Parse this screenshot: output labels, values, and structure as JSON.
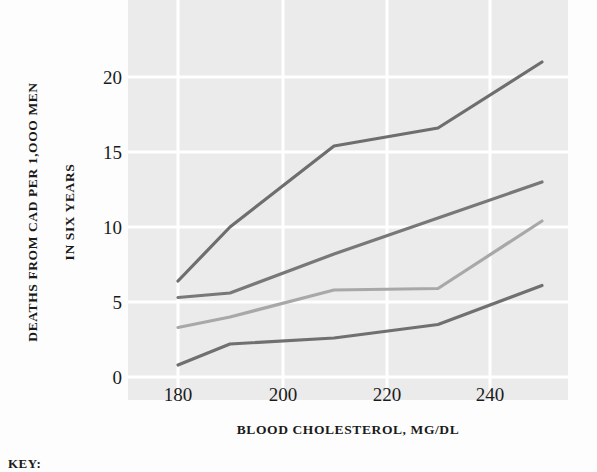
{
  "figure": {
    "key_label": "KEY:"
  },
  "axes": {
    "y_title_line1": "DEATHS FROM CAD PER 1,OOO MEN",
    "y_title_line2": "IN SIX YEARS",
    "x_title": "BLOOD CHOLESTEROL, MG/DL",
    "y_ticks": [
      "0",
      "5",
      "10",
      "15",
      "20"
    ],
    "x_ticks": [
      "180",
      "200",
      "220",
      "240"
    ]
  },
  "colors": {
    "plot_background": "#ebebeb",
    "gridline": "#ffffff",
    "series_1": "#6e6e6e",
    "series_2": "#787878",
    "series_3": "#a8a8a8",
    "series_4": "#707070",
    "text": "#1a1a1a"
  },
  "chart_data": {
    "type": "line",
    "title": "",
    "xlabel": "BLOOD CHOLESTEROL, MG/DL",
    "ylabel": "DEATHS FROM CAD PER 1,OOO MEN IN SIX YEARS",
    "xlim": [
      172,
      256
    ],
    "ylim": [
      -0.5,
      22.5
    ],
    "x_ticks": [
      180,
      200,
      220,
      240
    ],
    "y_ticks": [
      0,
      5,
      10,
      15,
      20
    ],
    "grid": true,
    "legend_position": "below-plot",
    "x": [
      180,
      190,
      210,
      230,
      250
    ],
    "series": [
      {
        "name": "series-1-highest",
        "color": "#6e6e6e",
        "values": [
          6.4,
          10.0,
          15.4,
          16.6,
          21.0
        ]
      },
      {
        "name": "series-2",
        "color": "#787878",
        "values": [
          5.3,
          5.6,
          8.2,
          10.6,
          13.0
        ]
      },
      {
        "name": "series-3",
        "color": "#a8a8a8",
        "values": [
          3.3,
          4.0,
          5.8,
          5.9,
          10.4
        ]
      },
      {
        "name": "series-4-lowest",
        "color": "#707070",
        "values": [
          0.8,
          2.2,
          2.6,
          3.5,
          6.1
        ]
      }
    ]
  }
}
